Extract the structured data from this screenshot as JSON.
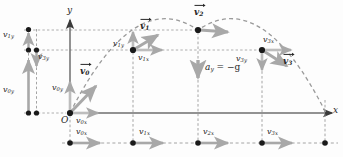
{
  "figure": {
    "type": "projectile-motion-diagram",
    "axes": {
      "x_label": "x",
      "y_label": "y",
      "origin_label": "O"
    },
    "acceleration": {
      "label": "a_y  =  −g",
      "text": "a",
      "sub": "y",
      "rest": " = −g",
      "direction": "down"
    },
    "points": [
      {
        "id": "p0",
        "x": 70,
        "y": 113,
        "vector": "v0"
      },
      {
        "id": "p1",
        "x": 133,
        "y": 50,
        "vector": "v1"
      },
      {
        "id": "p2",
        "x": 198,
        "y": 30,
        "vector": "v2"
      },
      {
        "id": "p3",
        "x": 262,
        "y": 50,
        "vector": "v3"
      },
      {
        "id": "p4",
        "x": 325,
        "y": 113,
        "vector": null
      }
    ],
    "velocity_vectors": [
      {
        "name": "v0",
        "base": "v",
        "sub": "0",
        "label": "v⃗0"
      },
      {
        "name": "v1",
        "base": "v",
        "sub": "1",
        "label": "v⃗1"
      },
      {
        "name": "v2",
        "base": "v",
        "sub": "2",
        "label": "v⃗2"
      },
      {
        "name": "v3",
        "base": "v",
        "sub": "3",
        "label": "v⃗3"
      }
    ],
    "components": {
      "x_components": [
        {
          "base": "v",
          "sub": "0x"
        },
        {
          "base": "v",
          "sub": "1x"
        },
        {
          "base": "v",
          "sub": "2x"
        },
        {
          "base": "v",
          "sub": "3x"
        }
      ],
      "y_components": [
        {
          "base": "v",
          "sub": "0y"
        },
        {
          "base": "v",
          "sub": "1y"
        },
        {
          "base": "v",
          "sub": "3y"
        }
      ]
    },
    "labels": {
      "v0": {
        "base": "v",
        "sub": "0"
      },
      "v1": {
        "base": "v",
        "sub": "1"
      },
      "v2": {
        "base": "v",
        "sub": "2"
      },
      "v3": {
        "base": "v",
        "sub": "3"
      },
      "v0x": {
        "base": "v",
        "sub": "0x"
      },
      "v1x": {
        "base": "v",
        "sub": "1x"
      },
      "v2x": {
        "base": "v",
        "sub": "2x"
      },
      "v3x": {
        "base": "v",
        "sub": "3x"
      },
      "v0y": {
        "base": "v",
        "sub": "0y"
      },
      "v1y": {
        "base": "v",
        "sub": "1y"
      },
      "v3y": {
        "base": "v",
        "sub": "3y"
      }
    },
    "colors": {
      "arrow_gray": "#a8a8a8",
      "dashed_gray": "#9a9a9a",
      "axis_gray": "#8c8c8c",
      "dot_black": "#1a1a1a",
      "text": "#262626",
      "background": "#fdfdfd"
    }
  }
}
